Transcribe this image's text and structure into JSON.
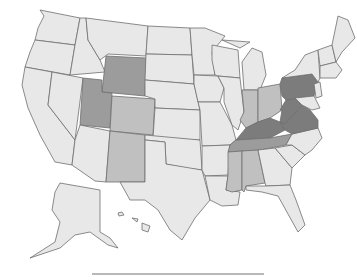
{
  "map": {
    "type": "choropleth",
    "region": "United States",
    "colors": {
      "level_0": "#e8e8e8",
      "level_1": "#c0c0c0",
      "level_2": "#9c9c9c",
      "level_3": "#7c7c7c",
      "border": "#6e6e6e",
      "background": "#ffffff"
    },
    "shaded_states": {
      "level_3": [
        "PA",
        "WV",
        "VA",
        "KY"
      ],
      "level_2": [
        "WY",
        "UT",
        "TN"
      ],
      "level_1": [
        "CO",
        "NM",
        "IN",
        "OH",
        "MS",
        "AL"
      ]
    }
  },
  "legend": {
    "visible_bar": true
  }
}
